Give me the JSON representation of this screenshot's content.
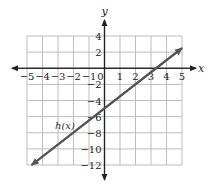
{
  "chart_data": {
    "type": "line",
    "title": "",
    "xlabel": "x",
    "ylabel": "y",
    "xlim": [
      -5,
      5
    ],
    "ylim": [
      -12,
      4
    ],
    "grid": true,
    "x_ticks": [
      -5,
      -4,
      -3,
      -2,
      -1,
      0,
      1,
      2,
      3,
      4,
      5
    ],
    "x_tick_labels": [
      "−5",
      "−4",
      "−3",
      "−2",
      "−1",
      "0",
      "1",
      "2",
      "3",
      "4",
      "5"
    ],
    "y_ticks": [
      4,
      2,
      -2,
      -4,
      -6,
      -8,
      -10,
      -12
    ],
    "y_tick_labels": [
      "4",
      "2",
      "−2",
      "−4",
      "−6",
      "−8",
      "−10",
      "−12"
    ],
    "series": [
      {
        "name": "h(x)",
        "label": "h(x)",
        "color": "#555555",
        "x": [
          -4.7,
          0,
          3.33,
          5
        ],
        "y": [
          -12,
          -5,
          0,
          2.5
        ],
        "arrows_both_ends": true
      }
    ],
    "legend": "inline label near line at x≈-2.5, y≈-7"
  },
  "colors": {
    "grid": "#bdbdbd",
    "axis": "#222222",
    "line": "#555555"
  }
}
